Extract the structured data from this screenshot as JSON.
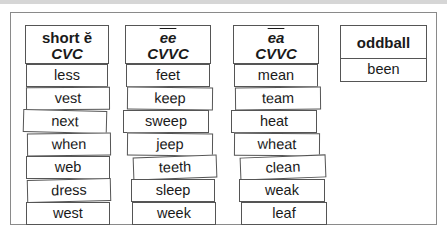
{
  "worksheet": {
    "title_band_color": "#d6d6d6",
    "columns": [
      {
        "header_line1": "short ĕ",
        "header_line2": "CVC",
        "words": [
          "less",
          "vest",
          "next",
          "when",
          "web",
          "dress",
          "west"
        ]
      },
      {
        "header_line1": "ee",
        "header_line2": "CVVC",
        "words": [
          "feet",
          "keep",
          "sweep",
          "jeep",
          "teeth",
          "sleep",
          "week"
        ]
      },
      {
        "header_line1": "ea",
        "header_line2": "CVVC",
        "words": [
          "mean",
          "team",
          "heat",
          "wheat",
          "clean",
          "weak",
          "leaf"
        ]
      },
      {
        "header_line1": "oddball",
        "words": [
          "been"
        ]
      }
    ]
  }
}
